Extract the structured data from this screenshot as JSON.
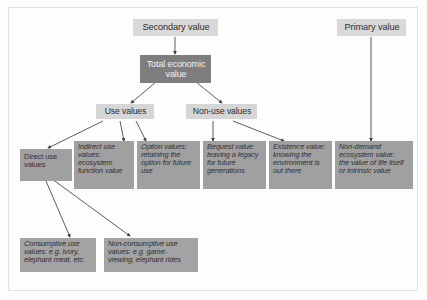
{
  "diagram": {
    "title_tags": {
      "secondary": "Secondary value",
      "primary": "Primary value"
    },
    "root": "Total economic\nvalue",
    "mid": {
      "use": "Use values",
      "nonuse": "Non-use values"
    },
    "leaves": {
      "direct": "Direct use\nvalues",
      "indirect": "Indirect use\nvalues:\necosystem\nfunction value",
      "option": "Option values:\nretaining the\noption for future\nuse",
      "bequest": "Bequest value:\nleaving a legacy\nfor future\ngenerations",
      "existence": "Existence value:\nknowing the\nenvironment is\nout there",
      "nondemand": "Non-demand\necosystem value:\nthe value of life itself\nor intrinsic value"
    },
    "bottom": {
      "consumptive": "Consumptive use\nvalues: e.g. ivory,\nelephant meat, etc.",
      "nonconsumptive": "Non-consumptive use\nvalues: e.g. game-\nviewing, elephant rides"
    },
    "colors": {
      "tag_fill": "#d9d9d9",
      "root_fill": "#7e7e7e",
      "leaf_fill": "#a0a0a0",
      "bottom_fill": "#a3a3a3",
      "line": "#4a4a4a",
      "frame": "#e2e2e2",
      "page": "#fdfdfd"
    }
  }
}
